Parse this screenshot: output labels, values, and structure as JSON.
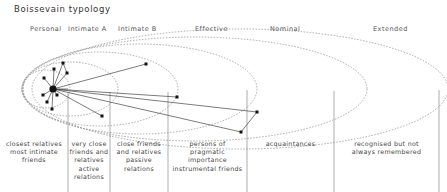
{
  "title": "Boissevain typology",
  "zones": [
    {
      "label": "Personal",
      "description": "closest relatives most intimate friends"
    },
    {
      "label": "Intimate A",
      "description": "very close friends and relatives active relations"
    },
    {
      "label": "Intimate B",
      "description": "close friends and relatives passive relations"
    },
    {
      "label": "Effective",
      "description": "persons of pragmatic importance instrumental friends"
    },
    {
      "label": "Nominal",
      "description": "acquaintances"
    },
    {
      "label": "Extended",
      "description": "recognised but not always remembered"
    }
  ],
  "descriptions": {
    "personal": [
      "closest relatives",
      "most intimate",
      "friends"
    ],
    "intimate_a": [
      "very close",
      "friends and",
      "relatives",
      "active",
      "relations"
    ],
    "intimate_b": [
      "close friends",
      "and relatives",
      "passive",
      "relations"
    ],
    "effective": [
      "persons of",
      "pragmatic",
      "importance",
      "instrumental friends"
    ],
    "nominal": [
      "acquaintances"
    ],
    "extended": [
      "recognised but not",
      "always remembered"
    ]
  }
}
